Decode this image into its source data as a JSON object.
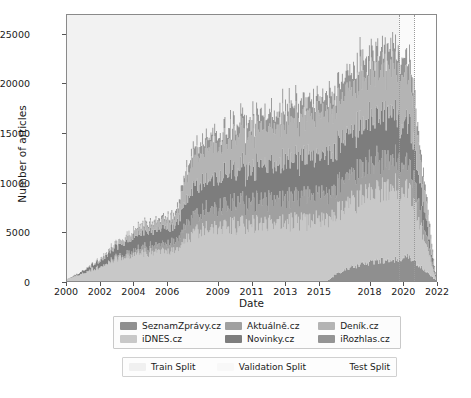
{
  "chart_data": {
    "type": "area",
    "title": "",
    "xlabel": "Date",
    "ylabel": "Number of articles",
    "xlim": [
      2000.0,
      2022.0
    ],
    "ylim": [
      0,
      27000
    ],
    "grid": false,
    "legend_position": "below-axes",
    "xticks": [
      "2000",
      "2002",
      "2004",
      "2006",
      "2009",
      "2011",
      "2013",
      "2015",
      "2018",
      "2020",
      "2022"
    ],
    "xtick_values": [
      2000,
      2002,
      2004,
      2006,
      2009,
      2011,
      2013,
      2015,
      2018,
      2020,
      2022
    ],
    "yticks": [
      "0",
      "5000",
      "10000",
      "15000",
      "20000",
      "25000"
    ],
    "ytick_values": [
      0,
      5000,
      10000,
      15000,
      20000,
      25000
    ],
    "stacked": true,
    "x": [
      2000.0,
      2000.5,
      2001.0,
      2001.5,
      2002.0,
      2002.5,
      2003.0,
      2003.5,
      2004.0,
      2004.5,
      2005.0,
      2005.5,
      2006.0,
      2006.5,
      2007.0,
      2007.5,
      2008.0,
      2008.5,
      2009.0,
      2009.5,
      2010.0,
      2010.5,
      2011.0,
      2011.5,
      2012.0,
      2012.5,
      2013.0,
      2013.5,
      2014.0,
      2014.5,
      2015.0,
      2015.5,
      2016.0,
      2016.5,
      2017.0,
      2017.5,
      2018.0,
      2018.5,
      2019.0,
      2019.5,
      2020.0,
      2020.5,
      2021.0,
      2021.5,
      2022.0
    ],
    "series": [
      {
        "name": "SeznamZpravy.cz",
        "color": "#8f8f8f",
        "values": [
          0,
          0,
          0,
          0,
          0,
          0,
          0,
          0,
          0,
          0,
          0,
          0,
          0,
          0,
          0,
          0,
          0,
          0,
          0,
          0,
          0,
          0,
          0,
          0,
          0,
          0,
          0,
          0,
          0,
          0,
          0,
          0,
          700,
          1100,
          1400,
          1700,
          1900,
          2000,
          2100,
          2200,
          2300,
          2400,
          1500,
          800,
          0
        ]
      },
      {
        "name": "iDNES.cz",
        "color": "#c8c8c8",
        "values": [
          200,
          500,
          900,
          1200,
          1500,
          1900,
          2300,
          2500,
          2700,
          2900,
          2900,
          2900,
          2900,
          3000,
          4200,
          5000,
          5200,
          5300,
          5400,
          5500,
          5600,
          5700,
          5800,
          5900,
          5900,
          5900,
          6000,
          6000,
          6100,
          6100,
          6200,
          6300,
          6400,
          6500,
          6600,
          6800,
          7000,
          7100,
          7200,
          7300,
          7000,
          6500,
          4200,
          2200,
          0
        ]
      },
      {
        "name": "Aktualne.cz",
        "color": "#a0a0a0",
        "values": [
          0,
          0,
          0,
          0,
          0,
          100,
          200,
          300,
          400,
          500,
          600,
          700,
          800,
          900,
          1400,
          1700,
          1800,
          1900,
          2000,
          2100,
          2200,
          2200,
          2300,
          2300,
          2400,
          2400,
          2400,
          2500,
          2500,
          2500,
          2600,
          2600,
          2700,
          2700,
          2800,
          2900,
          3000,
          3000,
          3000,
          3000,
          2900,
          2700,
          1800,
          900,
          0
        ]
      },
      {
        "name": "Novinky.cz",
        "color": "#7d7d7d",
        "values": [
          0,
          100,
          300,
          500,
          700,
          900,
          1100,
          1300,
          1400,
          1500,
          1500,
          1500,
          1600,
          1700,
          2400,
          2800,
          2900,
          3000,
          3100,
          3200,
          3300,
          3400,
          3500,
          3500,
          3600,
          3600,
          3700,
          3700,
          3800,
          3800,
          3900,
          3900,
          4000,
          4100,
          4200,
          4300,
          4400,
          4400,
          4500,
          4500,
          4300,
          4000,
          2600,
          1300,
          0
        ]
      },
      {
        "name": "Denik.cz",
        "color": "#b4b4b4",
        "values": [
          0,
          0,
          0,
          100,
          200,
          300,
          400,
          500,
          600,
          700,
          700,
          800,
          800,
          900,
          2200,
          3000,
          3200,
          3300,
          3400,
          3500,
          3600,
          3700,
          3800,
          3900,
          3900,
          4000,
          4000,
          4100,
          4100,
          4200,
          4200,
          4300,
          4400,
          4500,
          4600,
          4700,
          4800,
          4800,
          4900,
          4900,
          4700,
          4400,
          2800,
          1400,
          0
        ]
      },
      {
        "name": "iRozhlas.cz",
        "color": "#949494",
        "values": [
          0,
          0,
          0,
          0,
          0,
          0,
          0,
          0,
          100,
          200,
          200,
          300,
          300,
          400,
          700,
          900,
          1000,
          1000,
          1100,
          1100,
          1200,
          1200,
          1300,
          1300,
          1300,
          1400,
          1400,
          1400,
          1500,
          1500,
          1500,
          1600,
          1600,
          1700,
          1700,
          1800,
          1800,
          1900,
          1900,
          1900,
          1800,
          1700,
          1100,
          600,
          0
        ]
      }
    ],
    "splits": [
      {
        "name": "Train Split",
        "color": "#f2f2f2",
        "start": 2000.0,
        "end": 2019.7
      },
      {
        "name": "Validation Split",
        "color": "#fafafa",
        "start": 2019.7,
        "end": 2020.6
      },
      {
        "name": "Test Split",
        "color": "#ffffff",
        "start": 2020.6,
        "end": 2022.0
      }
    ],
    "split_dividers": [
      2019.7,
      2020.6
    ]
  },
  "axes": {
    "ylabel": "Number of articles",
    "xlabel": "Date"
  },
  "legend": {
    "series_entries": [
      {
        "label": "SeznamZprávy.cz",
        "color": "#8f8f8f"
      },
      {
        "label": "Aktuálně.cz",
        "color": "#a0a0a0"
      },
      {
        "label": "Deník.cz",
        "color": "#b4b4b4"
      },
      {
        "label": "iDNES.cz",
        "color": "#c8c8c8"
      },
      {
        "label": "Novinky.cz",
        "color": "#7d7d7d"
      },
      {
        "label": "iRozhlas.cz",
        "color": "#949494"
      }
    ],
    "split_entries": [
      {
        "label": "Train Split",
        "color": "#f0f0f0"
      },
      {
        "label": "Validation Split",
        "color": "#f8f8f8"
      },
      {
        "label": "Test Split",
        "color": "#fdfdfd"
      }
    ]
  }
}
